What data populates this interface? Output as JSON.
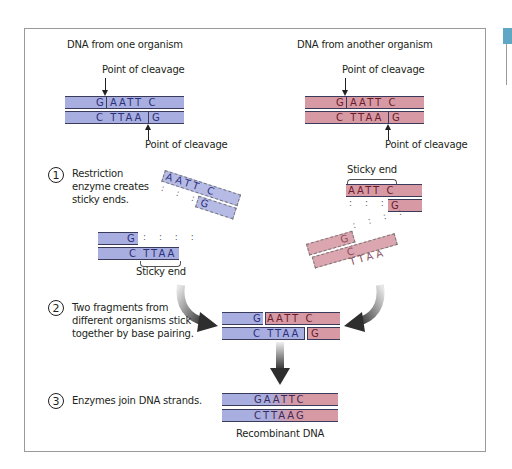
{
  "diagram": {
    "left_title": "DNA from one organism",
    "right_title": "DNA from another organism",
    "cleavage_label": "Point of cleavage",
    "sticky_end_label": "Sticky end",
    "recombinant_label": "Recombinant DNA",
    "colors": {
      "organism_one": "#a8aee0",
      "organism_two": "#d79aa5",
      "accent_tab": "#5fa7c4"
    },
    "steps": [
      {
        "number": "1",
        "text_lines": [
          "Restriction",
          "enzyme creates",
          "sticky ends."
        ]
      },
      {
        "number": "2",
        "text_lines": [
          "Two fragments from",
          "different organisms stick",
          "together by base pairing."
        ]
      },
      {
        "number": "3",
        "text_lines": [
          "Enzymes join DNA strands."
        ]
      }
    ],
    "sequences": {
      "top_left": "G",
      "top_right": "AATT C",
      "bottom_left": "C TTAA",
      "bottom_right": "G",
      "sticky_top": "AATT C",
      "sticky_bottom": "G",
      "frag_top": "G",
      "frag_bottom": "C TTAA",
      "pair_dots": ": : : :",
      "joined_top": "GAATTC",
      "joined_bottom": "CTTAAG"
    }
  }
}
